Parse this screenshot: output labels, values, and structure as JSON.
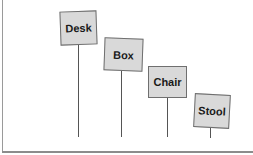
{
  "diagram": {
    "type": "signposts",
    "signs": [
      {
        "label": "Desk",
        "x": 60,
        "y": 11,
        "w": 37,
        "h": 34,
        "rotate": -2,
        "pole_x": 78,
        "pole_top": 45,
        "pole_bottom": 137
      },
      {
        "label": "Box",
        "x": 104,
        "y": 38,
        "w": 39,
        "h": 33,
        "rotate": 2,
        "pole_x": 121,
        "pole_top": 71,
        "pole_bottom": 137
      },
      {
        "label": "Chair",
        "x": 148,
        "y": 66,
        "w": 39,
        "h": 32,
        "rotate": 0,
        "pole_x": 167,
        "pole_top": 98,
        "pole_bottom": 137
      },
      {
        "label": "Stool",
        "x": 194,
        "y": 94,
        "w": 36,
        "h": 34,
        "rotate": 3,
        "pole_x": 210,
        "pole_top": 128,
        "pole_bottom": 138
      }
    ],
    "colors": {
      "sign_fill": "#d9d9d9",
      "sign_border": "#6f6f6f",
      "pole": "#555555",
      "frame": "#8c8c8c"
    }
  }
}
